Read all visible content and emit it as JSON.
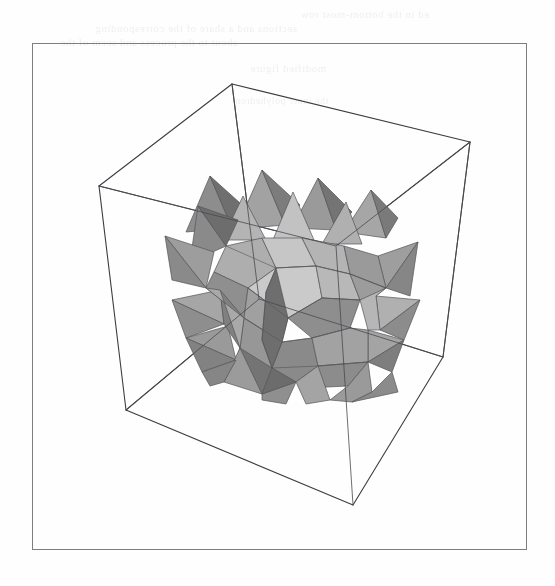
{
  "page": {
    "background_color": "#fefefe",
    "width": 555,
    "height": 586,
    "frame": {
      "name": "figure-border",
      "x": 32,
      "y": 43,
      "width": 495,
      "height": 507,
      "stroke_color": "#7d7d84",
      "stroke_width": 1
    }
  },
  "scan_artifacts": {
    "description": "faint mirrored show-through text from reverse side of scanned page",
    "color": "#2b2b44",
    "lines": [
      {
        "text": "ed in the bottom-most row",
        "x": 300,
        "y": 8,
        "size": 11
      },
      {
        "text": "sections and a share of the corresponding",
        "x": 95,
        "y": 22,
        "size": 11
      },
      {
        "text": "about to the process and seem of the",
        "x": 60,
        "y": 36,
        "size": 11
      },
      {
        "text": "modified  figure",
        "x": 250,
        "y": 62,
        "size": 11
      },
      {
        "text": "the inner polyhedron",
        "x": 235,
        "y": 95,
        "size": 10
      }
    ]
  },
  "figure": {
    "name": "stellated-polyhedron-in-bounding-box",
    "caption": "",
    "bounding_box": {
      "name": "wireframe-cube",
      "stroke_color": "#3c3c42",
      "stroke_width": 1.1,
      "vertices": {
        "top_back": [
          232,
          84
        ],
        "top_left": [
          99,
          186
        ],
        "top_right": [
          470,
          142
        ],
        "top_front": [
          336,
          246
        ],
        "bot_back": [
          259,
          299
        ],
        "bot_left": [
          126,
          410
        ],
        "bot_right": [
          443,
          357
        ],
        "bot_front": [
          353,
          505
        ]
      }
    },
    "solid": {
      "name": "great-stellated-polyhedron",
      "center": [
        293,
        288
      ],
      "spike_count": 20,
      "shading": {
        "lightest": "#cfcfcf",
        "light": "#bcbcbc",
        "mid_light": "#a8a8a8",
        "mid": "#989898",
        "mid_dark": "#8a8a8a",
        "dark": "#7a7a7a",
        "darkest": "#6b6b6b",
        "edge_color": "#55555a"
      }
    }
  }
}
